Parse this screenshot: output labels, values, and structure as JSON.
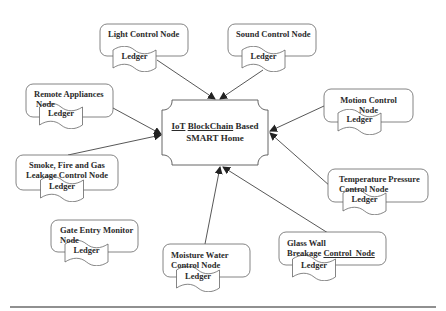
{
  "diagram": {
    "type": "hub-and-spoke",
    "center": {
      "line1_underlined_a": "IoT",
      "line1_underlined_b": "BlockChain",
      "line1_rest": "Based",
      "line2": "SMART Home"
    },
    "ledger_label": "Ledger",
    "nodes": [
      {
        "id": "light",
        "line1": "Light Control Node",
        "line2": ""
      },
      {
        "id": "sound",
        "line1": "Sound Control Node",
        "line2": ""
      },
      {
        "id": "remote",
        "line1": "Remote Appliances",
        "line2": "Node"
      },
      {
        "id": "motion",
        "line1": "Motion Control",
        "line2": "Node"
      },
      {
        "id": "smoke",
        "line1": "Smoke, Fire and Gas",
        "line2": "Leakage Control Node"
      },
      {
        "id": "temperature",
        "line1": "Temperature Pressure",
        "line2": "Control Node"
      },
      {
        "id": "gate",
        "line1": "Gate Entry Monitor",
        "line2": "Node"
      },
      {
        "id": "moisture",
        "line1": "Moisture Water",
        "line2": "Control Node"
      },
      {
        "id": "glass",
        "line1": "Glass Wall",
        "line2_a": "Breakage",
        "line2_b": "Control  Node"
      }
    ],
    "edges": [
      {
        "from": "light",
        "to": "center"
      },
      {
        "from": "sound",
        "to": "center"
      },
      {
        "from": "remote",
        "to": "center"
      },
      {
        "from": "smoke",
        "to": "center"
      },
      {
        "from": "motion",
        "to": "center"
      },
      {
        "from": "temperature",
        "to": "center"
      },
      {
        "from": "moisture",
        "to": "center"
      },
      {
        "from": "glass",
        "to": "center"
      }
    ],
    "colors": {
      "stroke": "#555555",
      "text": "#2b2b2b",
      "background": "#ffffff"
    }
  }
}
